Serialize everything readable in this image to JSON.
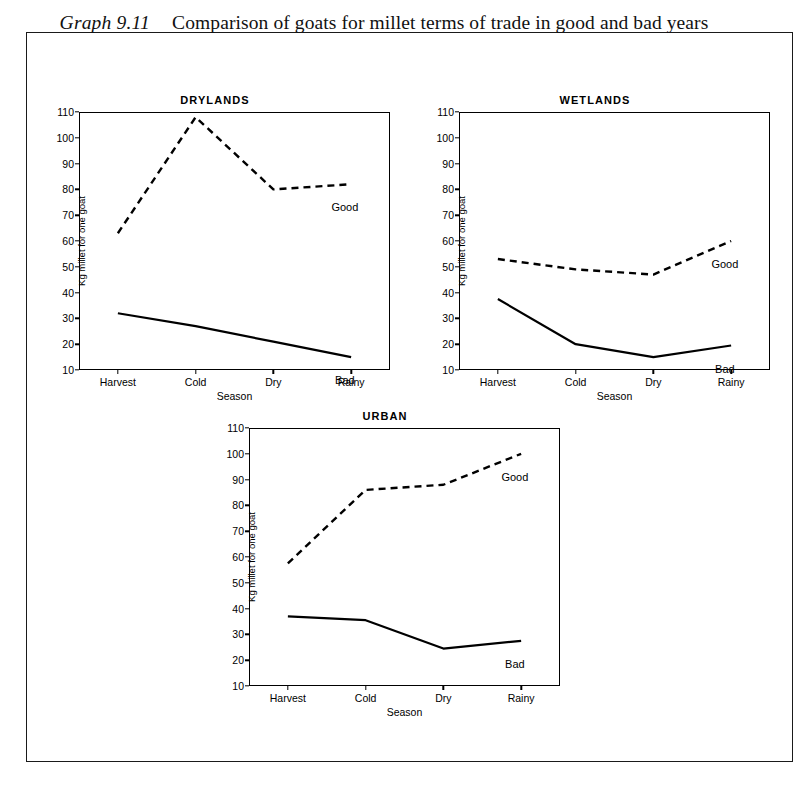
{
  "document": {
    "title_id": "Graph 9.11",
    "title_text": "Comparison of goats for millet terms of trade in good and bad years"
  },
  "axis": {
    "ylabel": "Kg millet for one goat",
    "xlabel": "Season",
    "yticks": [
      10,
      20,
      30,
      40,
      50,
      60,
      70,
      80,
      90,
      100,
      110
    ],
    "categories": [
      "Harvest",
      "Cold",
      "Dry",
      "Rainy"
    ],
    "ylim": [
      10,
      110
    ]
  },
  "series_labels": {
    "good": "Good",
    "bad": "Bad"
  },
  "colors": {
    "line": "#000000",
    "frame": "#000000",
    "background": "#ffffff"
  },
  "chart_data": [
    {
      "type": "line",
      "title": "DRYLANDS",
      "xlabel": "Season",
      "ylabel": "Kg millet for one goat",
      "categories": [
        "Harvest",
        "Cold",
        "Dry",
        "Rainy"
      ],
      "ylim": [
        10,
        110
      ],
      "yticks": [
        10,
        20,
        30,
        40,
        50,
        60,
        70,
        80,
        90,
        100,
        110
      ],
      "grid": false,
      "legend": "inline-right",
      "series": [
        {
          "name": "Good",
          "style": "dashed",
          "values": [
            63,
            108,
            80,
            82
          ]
        },
        {
          "name": "Bad",
          "style": "solid",
          "values": [
            32,
            27,
            21,
            15
          ]
        }
      ]
    },
    {
      "type": "line",
      "title": "WETLANDS",
      "xlabel": "Season",
      "ylabel": "Kg millet for one goat",
      "categories": [
        "Harvest",
        "Cold",
        "Dry",
        "Rainy"
      ],
      "ylim": [
        10,
        110
      ],
      "yticks": [
        10,
        20,
        30,
        40,
        50,
        60,
        70,
        80,
        90,
        100,
        110
      ],
      "grid": false,
      "legend": "inline-right",
      "series": [
        {
          "name": "Good",
          "style": "dashed",
          "values": [
            53,
            49,
            47,
            60
          ]
        },
        {
          "name": "Bad",
          "style": "solid",
          "values": [
            37.5,
            20,
            15,
            19.5
          ]
        }
      ]
    },
    {
      "type": "line",
      "title": "URBAN",
      "xlabel": "Season",
      "ylabel": "Kg millet for one goat",
      "categories": [
        "Harvest",
        "Cold",
        "Dry",
        "Rainy"
      ],
      "ylim": [
        10,
        110
      ],
      "yticks": [
        10,
        20,
        30,
        40,
        50,
        60,
        70,
        80,
        90,
        100,
        110
      ],
      "grid": false,
      "legend": "inline-right",
      "series": [
        {
          "name": "Good",
          "style": "dashed",
          "values": [
            57.5,
            86,
            88,
            100
          ]
        },
        {
          "name": "Bad",
          "style": "solid",
          "values": [
            37,
            35.5,
            24.5,
            27.5
          ]
        }
      ]
    }
  ]
}
